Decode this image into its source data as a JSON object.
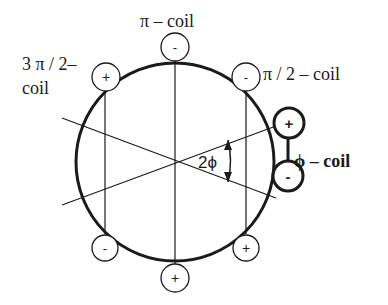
{
  "diagram": {
    "labels": {
      "pi_coil": "π –  coil",
      "three_pi_half_line1": "3 π / 2–",
      "three_pi_half_line2": "coil",
      "pi_half_coil": "π / 2 – coil",
      "phi_coil": "ϕ – coil",
      "angle": "2ϕ"
    },
    "terminals": {
      "top": "-",
      "upper_left": "+",
      "upper_right": "-",
      "phi_top": "+",
      "phi_bottom": "-",
      "lower_left": "-",
      "bottom": "+",
      "lower_right": "+"
    },
    "colors": {
      "stroke": "#1a1a1a",
      "background": "#ffffff"
    }
  }
}
